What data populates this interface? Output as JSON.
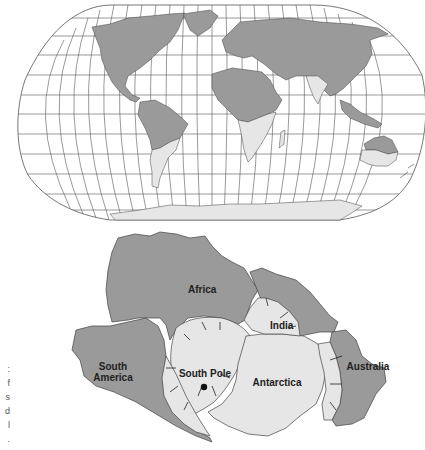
{
  "colors": {
    "land_dark": "#9a9a9a",
    "land_light": "#e6e6e6",
    "outline": "#444444",
    "grid": "#555555",
    "background": "#ffffff",
    "pole_dot": "#111111"
  },
  "world_map": {
    "projection": "Robinson-style graticule",
    "legend_meaning": {
      "dark": "non-glaciated continental area",
      "light": "areas with evidence of ancient glaciation"
    },
    "light_regions": [
      "southern Africa",
      "southern South America",
      "India",
      "southern Australia",
      "Antarctica"
    ]
  },
  "gondwana_map": {
    "labels": {
      "africa": "Africa",
      "south_america": "South America",
      "south_america_line1": "South",
      "south_america_line2": "America",
      "south_pole": "South Pole",
      "india": "India",
      "antarctica": "Antarctica",
      "australia": "Australia"
    }
  },
  "caption_fragment": [
    ":",
    "f",
    "s",
    "d",
    "l",
    "."
  ]
}
